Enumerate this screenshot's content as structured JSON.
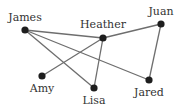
{
  "diagram": {
    "type": "network-graph",
    "colors": {
      "edge": "#6e6e6e",
      "node": "#1e1e1e",
      "label": "#333333",
      "background": "#ffffff"
    },
    "nodes": [
      {
        "id": "james",
        "label": "James",
        "x": 25,
        "y": 30,
        "lx": 25,
        "ly": 21,
        "anchor": "middle"
      },
      {
        "id": "heather",
        "label": "Heather",
        "x": 103,
        "y": 38,
        "lx": 103,
        "ly": 28,
        "anchor": "middle"
      },
      {
        "id": "juan",
        "label": "Juan",
        "x": 161,
        "y": 24,
        "lx": 161,
        "ly": 15,
        "anchor": "middle"
      },
      {
        "id": "amy",
        "label": "Amy",
        "x": 42,
        "y": 76,
        "lx": 42,
        "ly": 92,
        "anchor": "middle"
      },
      {
        "id": "lisa",
        "label": "Lisa",
        "x": 94,
        "y": 88,
        "lx": 94,
        "ly": 104,
        "anchor": "middle"
      },
      {
        "id": "jared",
        "label": "Jared",
        "x": 149,
        "y": 80,
        "lx": 149,
        "ly": 96,
        "anchor": "middle"
      }
    ],
    "edges": [
      {
        "from": "james",
        "to": "heather"
      },
      {
        "from": "james",
        "to": "lisa"
      },
      {
        "from": "james",
        "to": "jared"
      },
      {
        "from": "heather",
        "to": "juan"
      },
      {
        "from": "heather",
        "to": "amy"
      },
      {
        "from": "heather",
        "to": "lisa"
      },
      {
        "from": "juan",
        "to": "jared"
      }
    ]
  }
}
